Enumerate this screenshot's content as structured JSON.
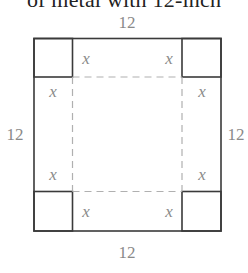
{
  "caption": "of metal with 12-inch",
  "diagram": {
    "outer_side_label_top": "12",
    "outer_side_label_left": "12",
    "outer_side_label_right": "12",
    "outer_side_label_bottom": "12",
    "cut_label": "x",
    "colors": {
      "solid_line": "#3a3a3a",
      "dashed_line": "#b0b0b0",
      "label": "#8a8a8a"
    }
  }
}
